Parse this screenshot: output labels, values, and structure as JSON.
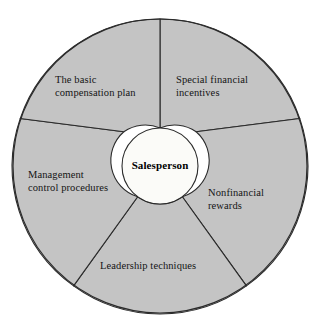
{
  "diagram": {
    "type": "hub-and-spoke-wheel",
    "hub": {
      "label": "Salesperson",
      "fill_color": "#fbfbf8",
      "stroke_color": "#2b2b2b"
    },
    "wheel": {
      "fill_color": "#c4c4c4",
      "stroke_color": "#2b2b2b",
      "segment_count": 5
    },
    "segments": [
      {
        "id": "compensation",
        "label": "The basic\ncompensation plan",
        "position": "upper-left"
      },
      {
        "id": "incentives",
        "label": "Special financial\nincentives",
        "position": "upper-right"
      },
      {
        "id": "management",
        "label": "Management\ncontrol procedures",
        "position": "left"
      },
      {
        "id": "nonfinancial",
        "label": "Nonfinancial\nrewards",
        "position": "right"
      },
      {
        "id": "leadership",
        "label": "Leadership techniques",
        "position": "bottom"
      }
    ]
  }
}
